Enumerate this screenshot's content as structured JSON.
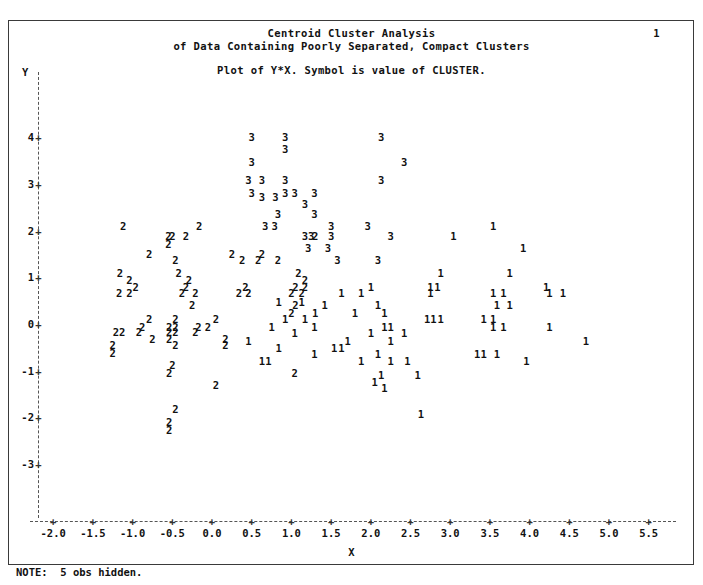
{
  "page": {
    "number": "1",
    "note": "NOTE:  5 obs hidden."
  },
  "header": {
    "title_line1": "Centroid Cluster Analysis",
    "title_line2": "of Data Containing Poorly Separated, Compact Clusters",
    "subtitle": "Plot of Y*X. Symbol is value of CLUSTER."
  },
  "chart_data": {
    "type": "scatter",
    "title": "Centroid Cluster Analysis of Data Containing Poorly Separated, Compact Clusters",
    "subtitle": "Plot of Y*X. Symbol is value of CLUSTER.",
    "xlabel": "X",
    "ylabel": "Y",
    "xlim": [
      -2.6,
      6.0
    ],
    "ylim": [
      -3.6,
      4.6
    ],
    "xticks": [
      "-2.0",
      "-1.5",
      "-1.0",
      "-0.5",
      "0.0",
      "0.5",
      "1.0",
      "1.5",
      "2.0",
      "2.5",
      "3.0",
      "3.5",
      "4.0",
      "4.5",
      "5.0",
      "5.5"
    ],
    "xtick_values": [
      -2.0,
      -1.5,
      -1.0,
      -0.5,
      0.0,
      0.5,
      1.0,
      1.5,
      2.0,
      2.5,
      3.0,
      3.5,
      4.0,
      4.5,
      5.0,
      5.5
    ],
    "yticks": [
      "4",
      "3",
      "2",
      "1",
      "0",
      "-1",
      "-2",
      "-3"
    ],
    "ytick_values": [
      4,
      3,
      2,
      1,
      0,
      -1,
      -2,
      -3
    ],
    "tick_mark_glyph": "+",
    "axis_style": "dashed",
    "grid": false,
    "legend": "none",
    "symbol_is": "value of CLUSTER",
    "series": [
      {
        "name": "3",
        "symbol": "3",
        "points": [
          [
            0.5,
            4.0
          ],
          [
            0.92,
            4.0
          ],
          [
            2.13,
            4.0
          ],
          [
            0.92,
            3.74
          ],
          [
            0.5,
            3.47
          ],
          [
            2.42,
            3.47
          ],
          [
            0.46,
            3.08
          ],
          [
            0.63,
            3.08
          ],
          [
            0.92,
            3.08
          ],
          [
            2.13,
            3.08
          ],
          [
            0.5,
            2.8
          ],
          [
            0.92,
            2.8
          ],
          [
            1.04,
            2.8
          ],
          [
            1.29,
            2.8
          ],
          [
            0.63,
            2.72
          ],
          [
            0.8,
            2.72
          ],
          [
            1.17,
            2.56
          ],
          [
            0.83,
            2.36
          ],
          [
            1.29,
            2.36
          ],
          [
            0.67,
            2.1
          ],
          [
            0.79,
            2.1
          ],
          [
            1.5,
            2.1
          ],
          [
            1.96,
            2.1
          ],
          [
            1.17,
            1.88
          ],
          [
            1.25,
            1.88
          ],
          [
            1.5,
            1.88
          ],
          [
            2.25,
            1.88
          ],
          [
            1.21,
            1.62
          ],
          [
            1.46,
            1.62
          ],
          [
            1.58,
            1.36
          ],
          [
            2.09,
            1.36
          ]
        ]
      },
      {
        "name": "2",
        "symbol": "2",
        "points": [
          [
            -1.12,
            2.1
          ],
          [
            -0.16,
            2.1
          ],
          [
            -0.55,
            1.88
          ],
          [
            -0.5,
            1.88
          ],
          [
            -0.33,
            1.88
          ],
          [
            1.3,
            1.88
          ],
          [
            -0.55,
            1.72
          ],
          [
            -0.79,
            1.5
          ],
          [
            0.25,
            1.5
          ],
          [
            0.63,
            1.5
          ],
          [
            -0.46,
            1.36
          ],
          [
            0.38,
            1.36
          ],
          [
            0.58,
            1.36
          ],
          [
            0.83,
            1.36
          ],
          [
            -1.16,
            1.1
          ],
          [
            -0.42,
            1.1
          ],
          [
            1.09,
            1.1
          ],
          [
            -1.04,
            0.95
          ],
          [
            -0.29,
            0.95
          ],
          [
            1.17,
            0.95
          ],
          [
            -0.96,
            0.8
          ],
          [
            -0.33,
            0.8
          ],
          [
            0.42,
            0.8
          ],
          [
            1.05,
            0.8
          ],
          [
            1.17,
            0.8
          ],
          [
            -1.17,
            0.66
          ],
          [
            -1.04,
            0.66
          ],
          [
            -0.38,
            0.66
          ],
          [
            -0.21,
            0.66
          ],
          [
            0.34,
            0.66
          ],
          [
            0.46,
            0.66
          ],
          [
            1.0,
            0.66
          ],
          [
            1.13,
            0.66
          ],
          [
            -0.25,
            0.4
          ],
          [
            1.05,
            0.4
          ],
          [
            1.0,
            0.24
          ],
          [
            -0.79,
            0.1
          ],
          [
            -0.46,
            0.1
          ],
          [
            0.05,
            0.1
          ],
          [
            -0.88,
            -0.06
          ],
          [
            -0.54,
            -0.06
          ],
          [
            -0.46,
            -0.06
          ],
          [
            -0.17,
            -0.06
          ],
          [
            -0.05,
            -0.06
          ],
          [
            -1.21,
            -0.18
          ],
          [
            -1.13,
            -0.18
          ],
          [
            -0.92,
            -0.18
          ],
          [
            -0.54,
            -0.18
          ],
          [
            -0.46,
            -0.18
          ],
          [
            -0.21,
            -0.18
          ],
          [
            -0.75,
            -0.32
          ],
          [
            -0.54,
            -0.32
          ],
          [
            0.17,
            -0.32
          ],
          [
            -1.25,
            -0.46
          ],
          [
            -0.46,
            -0.46
          ],
          [
            0.17,
            -0.46
          ],
          [
            -1.25,
            -0.62
          ],
          [
            -0.5,
            -0.88
          ],
          [
            -0.54,
            -1.05
          ],
          [
            0.05,
            -1.3
          ],
          [
            1.04,
            -1.04
          ],
          [
            -0.46,
            -1.82
          ],
          [
            -0.54,
            -2.1
          ],
          [
            -0.54,
            -2.28
          ]
        ]
      },
      {
        "name": "1",
        "symbol": "1",
        "points": [
          [
            3.54,
            2.1
          ],
          [
            3.04,
            1.88
          ],
          [
            3.92,
            1.62
          ],
          [
            2.88,
            1.1
          ],
          [
            3.75,
            1.1
          ],
          [
            2.0,
            0.8
          ],
          [
            2.75,
            0.8
          ],
          [
            2.84,
            0.8
          ],
          [
            4.21,
            0.8
          ],
          [
            1.63,
            0.66
          ],
          [
            1.88,
            0.66
          ],
          [
            2.75,
            0.66
          ],
          [
            3.54,
            0.66
          ],
          [
            3.67,
            0.66
          ],
          [
            4.25,
            0.66
          ],
          [
            4.42,
            0.66
          ],
          [
            0.84,
            0.48
          ],
          [
            1.13,
            0.48
          ],
          [
            1.42,
            0.4
          ],
          [
            2.09,
            0.4
          ],
          [
            3.59,
            0.4
          ],
          [
            3.75,
            0.4
          ],
          [
            1.3,
            0.24
          ],
          [
            1.8,
            0.24
          ],
          [
            2.17,
            0.24
          ],
          [
            0.92,
            0.1
          ],
          [
            1.17,
            0.1
          ],
          [
            2.71,
            0.1
          ],
          [
            2.79,
            0.1
          ],
          [
            2.88,
            0.1
          ],
          [
            3.42,
            0.1
          ],
          [
            3.54,
            0.1
          ],
          [
            0.75,
            -0.06
          ],
          [
            1.29,
            -0.06
          ],
          [
            2.17,
            -0.06
          ],
          [
            2.25,
            -0.06
          ],
          [
            3.54,
            -0.06
          ],
          [
            3.67,
            -0.06
          ],
          [
            4.25,
            -0.06
          ],
          [
            1.04,
            -0.2
          ],
          [
            2.0,
            -0.2
          ],
          [
            2.42,
            -0.2
          ],
          [
            0.46,
            -0.36
          ],
          [
            1.71,
            -0.36
          ],
          [
            2.25,
            -0.36
          ],
          [
            4.71,
            -0.36
          ],
          [
            0.84,
            -0.52
          ],
          [
            1.54,
            -0.52
          ],
          [
            1.63,
            -0.52
          ],
          [
            1.29,
            -0.64
          ],
          [
            2.09,
            -0.64
          ],
          [
            3.34,
            -0.64
          ],
          [
            3.42,
            -0.64
          ],
          [
            3.59,
            -0.64
          ],
          [
            0.63,
            -0.8
          ],
          [
            0.71,
            -0.8
          ],
          [
            1.88,
            -0.8
          ],
          [
            2.25,
            -0.8
          ],
          [
            2.46,
            -0.8
          ],
          [
            3.96,
            -0.8
          ],
          [
            2.13,
            -1.1
          ],
          [
            2.59,
            -1.1
          ],
          [
            2.05,
            -1.24
          ],
          [
            2.17,
            -1.38
          ],
          [
            2.63,
            -1.92
          ]
        ]
      }
    ]
  }
}
